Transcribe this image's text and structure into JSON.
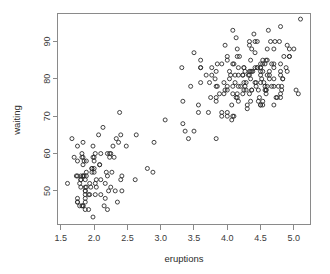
{
  "chart_data": {
    "type": "scatter",
    "title": "",
    "subtitle": "",
    "xlabel": "eruptions",
    "ylabel": "waiting",
    "xlim": [
      1.45,
      5.25
    ],
    "ylim": [
      41.0,
      97.5
    ],
    "xticks": [
      "1.5",
      "2.0",
      "2.5",
      "3.0",
      "3.5",
      "4.0",
      "4.5",
      "5.0"
    ],
    "xtick_values": [
      1.5,
      2.0,
      2.5,
      3.0,
      3.5,
      4.0,
      4.5,
      5.0
    ],
    "yticks": [
      "50",
      "60",
      "70",
      "80",
      "90"
    ],
    "ytick_values": [
      50,
      60,
      70,
      80,
      90
    ],
    "grid": false,
    "legend": null,
    "legend_position": "none",
    "marker": "open-circle",
    "marker_color": "#2e2e2e",
    "marker_radius": 2.0,
    "n_points": 272,
    "x": [
      3.6,
      1.8,
      3.333,
      2.283,
      4.533,
      2.883,
      4.7,
      3.6,
      1.95,
      4.35,
      1.833,
      3.917,
      4.2,
      1.75,
      4.7,
      2.167,
      1.75,
      4.8,
      1.6,
      4.25,
      1.8,
      1.75,
      3.45,
      3.067,
      4.533,
      3.6,
      1.967,
      4.083,
      3.85,
      4.433,
      4.3,
      4.467,
      3.367,
      4.033,
      3.833,
      2.017,
      1.867,
      4.833,
      1.833,
      4.783,
      4.35,
      1.883,
      4.567,
      1.75,
      4.533,
      3.317,
      3.833,
      2.1,
      4.633,
      2.0,
      4.8,
      4.716,
      1.833,
      4.833,
      1.733,
      4.883,
      3.717,
      1.667,
      4.567,
      4.317,
      2.233,
      4.5,
      1.75,
      4.8,
      1.817,
      4.4,
      4.167,
      4.7,
      2.067,
      4.7,
      4.033,
      1.967,
      4.5,
      4.0,
      1.983,
      5.067,
      2.017,
      4.567,
      3.883,
      3.6,
      4.133,
      4.333,
      4.1,
      2.633,
      4.067,
      4.933,
      3.95,
      4.517,
      2.167,
      4.0,
      2.2,
      4.333,
      1.867,
      4.817,
      1.833,
      4.3,
      4.667,
      3.75,
      1.867,
      4.9,
      2.483,
      4.367,
      2.1,
      4.5,
      4.05,
      1.867,
      4.7,
      1.783,
      4.85,
      3.683,
      4.733,
      2.3,
      4.9,
      4.417,
      1.7,
      4.633,
      2.317,
      4.6,
      1.817,
      4.417,
      2.617,
      4.067,
      4.25,
      1.967,
      4.6,
      3.767,
      1.917,
      4.5,
      2.267,
      4.65,
      1.867,
      4.167,
      2.8,
      4.333,
      1.833,
      4.383,
      1.883,
      4.933,
      2.033,
      3.733,
      4.233,
      2.233,
      4.533,
      4.817,
      4.333,
      1.983,
      4.633,
      2.017,
      5.1,
      1.8,
      5.033,
      4.0,
      2.4,
      4.6,
      3.567,
      4.0,
      4.5,
      4.083,
      1.8,
      3.967,
      2.2,
      4.15,
      2.0,
      3.833,
      3.5,
      4.583,
      2.367,
      5.0,
      1.933,
      4.617,
      1.917,
      2.083,
      4.583,
      3.333,
      4.167,
      4.333,
      4.5,
      2.417,
      4.0,
      4.167,
      1.883,
      4.583,
      4.25,
      3.767,
      2.033,
      4.433,
      4.083,
      1.833,
      4.417,
      2.183,
      4.8,
      1.833,
      4.8,
      4.1,
      3.966,
      4.233,
      3.5,
      4.366,
      2.25,
      4.667,
      2.1,
      4.35,
      4.133,
      1.867,
      4.6,
      1.783,
      4.367,
      3.85,
      1.933,
      4.5,
      2.383,
      4.7,
      1.867,
      3.833,
      3.417,
      4.233,
      2.4,
      4.8,
      2.0,
      4.15,
      1.867,
      4.267,
      1.75,
      4.483,
      4.0,
      4.117,
      4.083,
      4.267,
      3.917,
      4.55,
      4.083,
      2.417,
      4.183,
      2.217,
      4.45,
      1.883,
      1.85,
      4.283,
      3.95,
      2.333,
      4.15,
      2.35,
      4.933,
      2.9,
      4.583,
      3.833,
      2.083,
      4.367,
      2.133,
      4.35,
      2.2,
      4.45,
      3.567,
      4.5,
      4.15,
      3.817,
      3.917,
      4.45,
      2.0,
      4.283,
      4.767,
      4.533,
      1.85,
      4.25,
      1.983,
      2.25,
      4.75,
      4.117,
      2.15,
      4.417,
      1.817,
      4.467
    ],
    "y": [
      79,
      54,
      74,
      62,
      85,
      55,
      88,
      85,
      51,
      85,
      54,
      84,
      78,
      47,
      83,
      52,
      62,
      84,
      52,
      79,
      51,
      47,
      78,
      69,
      74,
      83,
      55,
      76,
      78,
      79,
      73,
      77,
      66,
      80,
      74,
      52,
      48,
      80,
      59,
      90,
      80,
      58,
      84,
      58,
      73,
      83,
      64,
      53,
      82,
      59,
      75,
      90,
      54,
      80,
      54,
      83,
      71,
      64,
      77,
      81,
      59,
      84,
      48,
      82,
      60,
      92,
      78,
      78,
      65,
      73,
      82,
      56,
      79,
      71,
      62,
      76,
      60,
      78,
      76,
      83,
      75,
      82,
      70,
      65,
      73,
      88,
      76,
      80,
      48,
      86,
      60,
      90,
      50,
      78,
      63,
      72,
      84,
      75,
      51,
      82,
      62,
      88,
      49,
      83,
      81,
      47,
      84,
      52,
      86,
      81,
      75,
      59,
      89,
      79,
      59,
      81,
      50,
      85,
      59,
      87,
      53,
      69,
      77,
      56,
      88,
      81,
      45,
      82,
      55,
      90,
      45,
      83,
      56,
      89,
      46,
      82,
      51,
      86,
      53,
      79,
      81,
      60,
      82,
      77,
      76,
      59,
      80,
      49,
      96,
      53,
      77,
      77,
      65,
      81,
      71,
      70,
      81,
      93,
      53,
      89,
      45,
      86,
      58,
      78,
      66,
      76,
      63,
      88,
      52,
      93,
      49,
      57,
      77,
      68,
      81,
      81,
      73,
      50,
      85,
      74,
      55,
      77,
      83,
      83,
      51,
      78,
      84,
      46,
      83,
      55,
      81,
      57,
      76,
      84,
      77,
      81,
      87,
      77,
      51,
      78,
      60,
      82,
      91,
      53,
      78,
      46,
      77,
      84,
      49,
      83,
      71,
      80,
      49,
      75,
      64,
      76,
      53,
      94,
      55,
      76,
      50,
      82,
      54,
      75,
      78,
      79,
      78,
      78,
      70,
      79,
      70,
      54,
      86,
      50,
      90,
      54,
      54,
      77,
      79,
      64,
      75,
      47,
      86,
      63,
      85,
      82,
      57,
      82,
      67,
      74,
      54,
      83,
      73,
      73,
      88,
      80,
      71,
      83,
      56,
      79,
      78,
      84,
      58,
      83,
      43,
      60,
      75,
      81,
      46,
      90,
      46,
      74
    ]
  },
  "plot": {
    "bg_color": "#ffffff",
    "axis_color": "#8a8a8a",
    "text_color": "#2b2b2b",
    "point_color": "#2e2e2e"
  }
}
